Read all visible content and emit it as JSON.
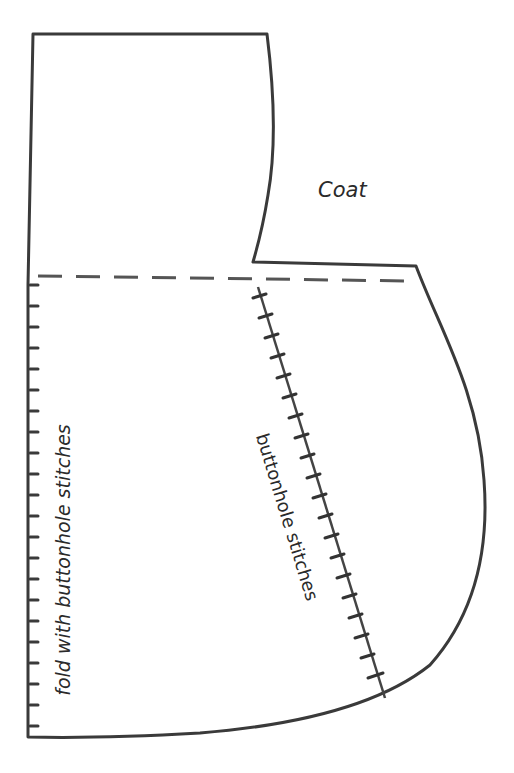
{
  "title": "Coat",
  "labels": {
    "fold": "fold with buttonhole stitches",
    "stitches": "buttonhole stitches"
  },
  "colors": {
    "outline": "#3a3a3a",
    "dash": "#555555",
    "stitch": "#333333",
    "text": "#2a2a2a",
    "background": "#ffffff"
  },
  "pattern": {
    "piece": "coat",
    "lines": [
      "outline",
      "fold-line (dashed)",
      "left fold edge with buttonhole stitches",
      "diagonal buttonhole stitch line"
    ]
  }
}
